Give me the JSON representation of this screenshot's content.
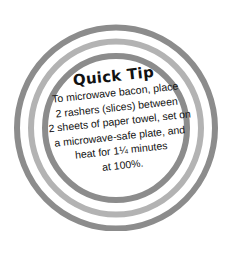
{
  "badge": {
    "title": "Quick Tip",
    "lines": [
      "To microwave bacon, place",
      "2 rashers (slices) between",
      "2 sheets of paper towel, set on",
      "a microwave-safe plate, and",
      "heat for 1¼ minutes",
      "at 100%."
    ],
    "colors": {
      "outer_ring": "#8c8c8c",
      "middle_ring": "#b3b3b3",
      "inner_ring": "#8c8c8c",
      "text": "#111111",
      "background": "#ffffff"
    }
  }
}
